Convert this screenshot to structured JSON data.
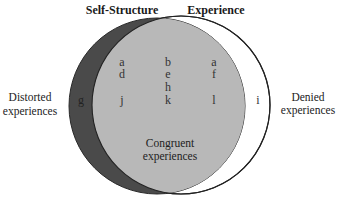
{
  "diagram": {
    "sets": [
      {
        "id": "self",
        "label": "Self-Structure",
        "color": "#4a4a4a"
      },
      {
        "id": "experience",
        "label": "Experience",
        "color": "#ffffff"
      }
    ],
    "intersection_color": "#b8b8b8",
    "region_labels": {
      "distorted": [
        "Distorted",
        "experiences"
      ],
      "denied": [
        "Denied",
        "experiences"
      ],
      "congruent": [
        "Congruent",
        "experiences"
      ]
    },
    "letters": {
      "self_only": [
        "g"
      ],
      "intersection": [
        [
          "a",
          "b",
          "a"
        ],
        [
          "d",
          "e",
          "f"
        ],
        [
          "",
          "h",
          ""
        ],
        [
          "j",
          "k",
          "l"
        ]
      ],
      "experience_only": [
        "i"
      ]
    }
  }
}
